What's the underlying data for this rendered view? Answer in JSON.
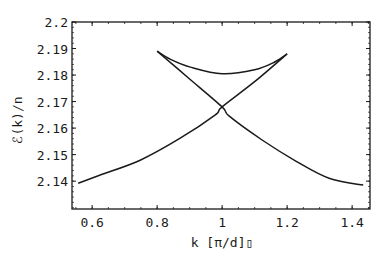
{
  "chart_data": {
    "type": "line",
    "title": "",
    "xlabel": "k [π/d]▯",
    "ylabel": "ℰ(k)/n",
    "xlim": [
      0.538,
      1.455
    ],
    "ylim": [
      2.1295,
      2.2
    ],
    "grid": false,
    "legend": null,
    "x_ticks": [
      0.6,
      0.8,
      1.0,
      1.2,
      1.4
    ],
    "x_tick_labels": [
      "0.6",
      "0.8",
      "1",
      "1.2",
      "1.4"
    ],
    "y_ticks": [
      2.14,
      2.15,
      2.16,
      2.17,
      2.18,
      2.19,
      2.2
    ],
    "y_tick_labels": [
      "2.14",
      "2.15",
      "2.16",
      "2.17",
      "2.18",
      "2.19",
      "2.2"
    ],
    "series": [
      {
        "name": "branch-rising",
        "x": [
          0.557,
          0.625,
          0.748,
          0.871,
          0.978,
          1.0,
          1.1,
          1.2
        ],
        "y": [
          2.1392,
          2.1423,
          2.1479,
          2.1562,
          2.1649,
          2.168,
          2.1775,
          2.188
        ]
      },
      {
        "name": "branch-falling",
        "x": [
          0.8,
          0.9,
          1.0,
          1.022,
          1.123,
          1.228,
          1.329,
          1.434
        ],
        "y": [
          2.189,
          2.1785,
          2.168,
          2.1645,
          2.1555,
          2.1475,
          2.1411,
          2.1385
        ]
      },
      {
        "name": "upper-arc",
        "x": [
          0.8,
          0.84,
          0.902,
          1.0,
          1.1,
          1.163,
          1.2
        ],
        "y": [
          2.189,
          2.186,
          2.183,
          2.1805,
          2.182,
          2.185,
          2.188
        ]
      }
    ]
  }
}
